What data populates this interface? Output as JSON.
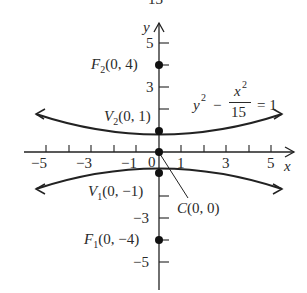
{
  "header_fragment": "13",
  "axes": {
    "x_label": "x",
    "y_label": "y",
    "x_ticks": [
      "−5",
      "−3",
      "−1",
      "0",
      "1",
      "3",
      "5"
    ],
    "y_ticks": [
      "5",
      "3",
      "1",
      "−1",
      "−3",
      "−5"
    ]
  },
  "equation": {
    "lhs": "y",
    "lhs_exp": "2",
    "minus": "−",
    "num": "x",
    "num_exp": "2",
    "den": "15",
    "rhs": "= 1"
  },
  "points": {
    "F2": {
      "name": "F",
      "sub": "2",
      "coords": "(0, 4)"
    },
    "V2": {
      "name": "V",
      "sub": "2",
      "coords": "(0, 1)"
    },
    "V1": {
      "name": "V",
      "sub": "1",
      "coords": "(0, −1)"
    },
    "C": {
      "name": "C",
      "coords": "(0, 0)"
    },
    "F1": {
      "name": "F",
      "sub": "1",
      "coords": "(0, −4)"
    }
  },
  "colors": {
    "ink": "#222222",
    "background": "#ffffff"
  }
}
